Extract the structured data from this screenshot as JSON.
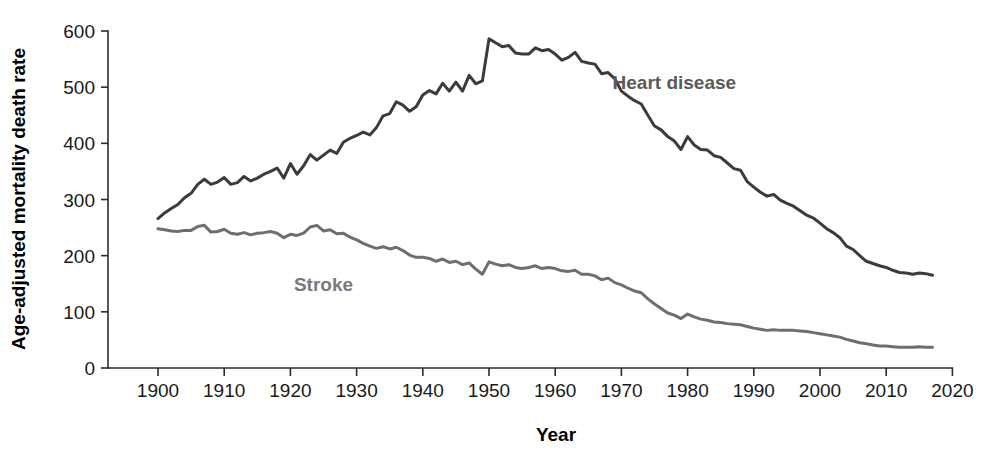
{
  "chart_data": {
    "type": "line",
    "title": "",
    "xlabel": "Year",
    "ylabel": "Age-adjusted mortality death rate",
    "xlim": [
      1893,
      2020
    ],
    "ylim": [
      0,
      600
    ],
    "grid": false,
    "legend_position": "inline-annotation",
    "xticks": [
      1900,
      1910,
      1920,
      1930,
      1940,
      1950,
      1960,
      1970,
      1980,
      1990,
      2000,
      2010,
      2020
    ],
    "xticklabels": [
      "1900",
      "1910",
      "1920",
      "1930",
      "1940",
      "1950",
      "1960",
      "1970",
      "1980",
      "1990",
      "2000",
      "2010",
      "2020"
    ],
    "yticks": [
      0,
      100,
      200,
      300,
      400,
      500,
      600
    ],
    "yticklabels": [
      "0",
      "100",
      "200",
      "300",
      "400",
      "500",
      "600"
    ],
    "x": [
      1900,
      1901,
      1902,
      1903,
      1904,
      1905,
      1906,
      1907,
      1908,
      1909,
      1910,
      1911,
      1912,
      1913,
      1914,
      1915,
      1916,
      1917,
      1918,
      1919,
      1920,
      1921,
      1922,
      1923,
      1924,
      1925,
      1926,
      1927,
      1928,
      1929,
      1930,
      1931,
      1932,
      1933,
      1934,
      1935,
      1936,
      1937,
      1938,
      1939,
      1940,
      1941,
      1942,
      1943,
      1944,
      1945,
      1946,
      1947,
      1948,
      1949,
      1950,
      1951,
      1952,
      1953,
      1954,
      1955,
      1956,
      1957,
      1958,
      1959,
      1960,
      1961,
      1962,
      1963,
      1964,
      1965,
      1966,
      1967,
      1968,
      1969,
      1970,
      1971,
      1972,
      1973,
      1974,
      1975,
      1976,
      1977,
      1978,
      1979,
      1980,
      1981,
      1982,
      1983,
      1984,
      1985,
      1986,
      1987,
      1988,
      1989,
      1990,
      1991,
      1992,
      1993,
      1994,
      1995,
      1996,
      1997,
      1998,
      1999,
      2000,
      2001,
      2002,
      2003,
      2004,
      2005,
      2006,
      2007,
      2008,
      2009,
      2010,
      2011,
      2012,
      2013,
      2014,
      2015,
      2016,
      2017
    ],
    "series": [
      {
        "name": "Heart disease",
        "color": "#3b3b3b",
        "label_x": 1978,
        "label_y": 497,
        "values": [
          266,
          276,
          284,
          291,
          303,
          311,
          327,
          336,
          327,
          331,
          339,
          327,
          330,
          341,
          333,
          338,
          345,
          350,
          356,
          338,
          364,
          345,
          360,
          380,
          370,
          379,
          388,
          382,
          402,
          409,
          414,
          420,
          415,
          428,
          449,
          453,
          474,
          468,
          457,
          465,
          486,
          494,
          488,
          507,
          493,
          509,
          493,
          521,
          506,
          511,
          586,
          579,
          572,
          574,
          561,
          559,
          559,
          570,
          565,
          567,
          559,
          548,
          553,
          562,
          546,
          543,
          541,
          524,
          526,
          515,
          493,
          484,
          476,
          470,
          450,
          431,
          424,
          412,
          404,
          389,
          412,
          397,
          389,
          388,
          378,
          375,
          365,
          355,
          352,
          332,
          322,
          313,
          306,
          309,
          299,
          293,
          288,
          280,
          272,
          267,
          258,
          248,
          241,
          232,
          217,
          211,
          200,
          190,
          186,
          182,
          179,
          174,
          170,
          169,
          167,
          169,
          168,
          165
        ],
        "label_color": "#5a5a5a"
      },
      {
        "name": "Stroke",
        "color": "#6e6e6e",
        "label_x": 1925,
        "label_y": 137,
        "values": [
          248,
          246,
          244,
          243,
          245,
          245,
          252,
          254,
          242,
          243,
          247,
          240,
          238,
          241,
          237,
          240,
          241,
          243,
          240,
          232,
          238,
          236,
          240,
          251,
          254,
          244,
          246,
          239,
          240,
          233,
          228,
          222,
          217,
          213,
          216,
          212,
          215,
          209,
          201,
          197,
          197,
          195,
          190,
          194,
          188,
          190,
          184,
          187,
          176,
          167,
          189,
          185,
          182,
          184,
          179,
          177,
          179,
          182,
          177,
          179,
          177,
          173,
          172,
          174,
          167,
          167,
          164,
          157,
          160,
          152,
          148,
          142,
          137,
          134,
          123,
          114,
          106,
          98,
          94,
          88,
          96,
          91,
          87,
          85,
          82,
          81,
          79,
          78,
          77,
          74,
          71,
          69,
          67,
          68,
          67,
          67,
          67,
          66,
          65,
          63,
          61,
          59,
          57,
          55,
          51,
          48,
          45,
          43,
          41,
          39,
          39,
          38,
          37,
          37,
          37,
          38,
          37,
          37
        ],
        "label_color": "#7a7a7a"
      }
    ]
  },
  "axes": {
    "y_axis_title": "Age-adjusted mortality death rate",
    "x_axis_title": "Year"
  }
}
